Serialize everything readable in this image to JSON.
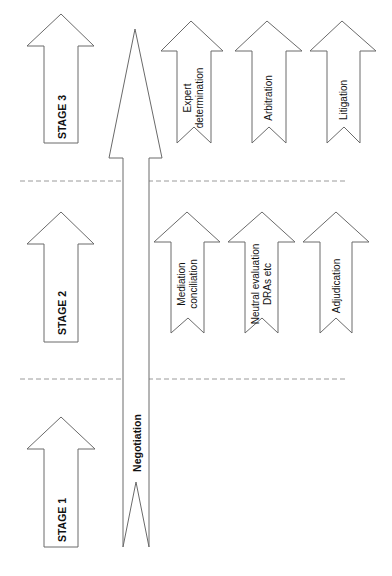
{
  "colors": {
    "stroke": "#6a6a6a",
    "divider": "#9a9a9a",
    "text": "#111111",
    "background": "#ffffff"
  },
  "stages": [
    {
      "label": "STAGE 3"
    },
    {
      "label": "STAGE 2"
    },
    {
      "label": "STAGE 1"
    }
  ],
  "negotiation": {
    "label": "Negotiation"
  },
  "stage3_methods": [
    {
      "line1": "Expert",
      "line2": "determination"
    },
    {
      "line1": "Arbitration",
      "line2": ""
    },
    {
      "line1": "Litigation",
      "line2": ""
    }
  ],
  "stage2_methods": [
    {
      "line1": "Mediation",
      "line2": "conciliation"
    },
    {
      "line1": "Neutral evaluation",
      "line2": "DRAs etc"
    },
    {
      "line1": "Adjudication",
      "line2": ""
    }
  ]
}
